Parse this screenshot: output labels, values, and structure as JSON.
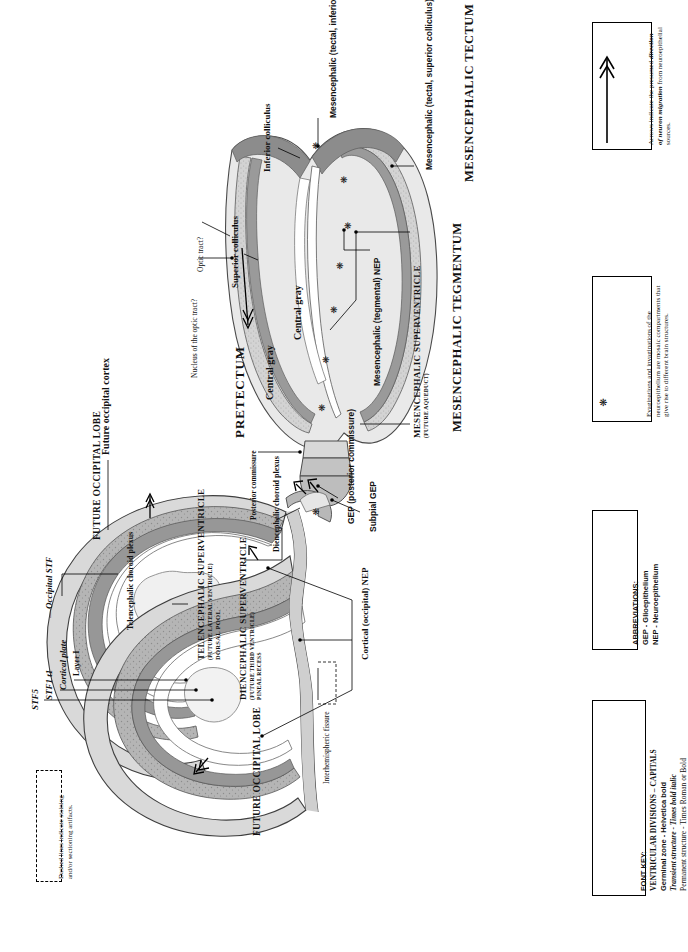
{
  "figure": {
    "orientation": "rotated-90-ccw",
    "type": "brain-section-schematic",
    "colors": {
      "neuroepithelium_dark": "#8f8f8f",
      "mantle_mid": "#b9b9b9",
      "cortex_light": "#dcdcdc",
      "ventricle_white": "#ffffff",
      "outline": "#3a3a3a",
      "text": "#111111"
    }
  },
  "labels": {
    "stf5": "STF5",
    "stf1t1": "STF1 t1",
    "occipital_stf": "Occipital STF",
    "cortical_plate": "Cortical plate",
    "layer_i": "Layer I",
    "future_occipital_cortex": "Future occipital cortex",
    "future_occipital_lobe_upper": "FUTURE OCCIPITAL LOBE",
    "future_occipital_lobe_lower": "FUTURE OCCIPITAL LOBE",
    "telencephalic_choroid_plexus": "Telencephalic choroid plexus",
    "telencephalic_superventricle": "TELENCEPHALIC SUPERVENTRICLE",
    "telencephalic_superventricle_sub": "(FUTURE LATERAL VENTRICLE)",
    "telencephalic_superventricle_sub2": "DORSAL POOL",
    "diencephalic_superventricle": "DIENCEPHALIC SUPERVENTRICLE",
    "diencephalic_superventricle_sub": "(FUTURE THIRD VENTRICLE)",
    "diencephalic_superventricle_sub2": "PINEAL RECESS",
    "diencephalic_choroid_plexus": "Diencephalic choroid plexus",
    "interhemispheric_fissure": "Interhemispheric fissure",
    "cortical_occipital_nep": "Cortical (occipital) NEP",
    "gep_posterior_commissure": "GEP (posterior commissure)",
    "subpial_gep": "Subpial GEP",
    "posterior_commissure": "Posterior commissure",
    "pretectum": "PRETECTUM",
    "central_gray_1": "Central gray",
    "central_gray_2": "Central gray",
    "nucleus_optic_tract": "Nucleus of the optic tract?",
    "optic_tract": "Optic tract?",
    "superior_colliculus": "Superior colliculus",
    "inferior_colliculus": "Inferior colliculus",
    "mesencephalic_tectal_inferior_nep": "Mesencephalic (tectal, inferior colliculus) NEP",
    "mesencephalic_tectal_superior_nep": "Mesencephalic (tectal, superior colliculus) NEP",
    "mesencephalic_tectum": "MESENCEPHALIC TECTUM",
    "mesencephalic_tegmental_nep": "Mesencephalic (tegmental) NEP",
    "mesencephalic_superventricle": "MESENCEPHALIC SUPERVENTRICLE",
    "mesencephalic_superventricle_sub": "(FUTURE AQUEDUCT)",
    "mesencephalic_tegmentum": "MESENCEPHALIC TEGMENTUM"
  },
  "notes": {
    "arrows": {
      "line1": "Arrows indicate the",
      "line2_a": "presumed ",
      "line2_b": "direction of",
      "line3_a": "neuron migration",
      "line3_b": " from",
      "line4": "neuroepithelial sources."
    },
    "asterisk": {
      "line1": "Evaginations and invaginations of the",
      "line2": "neuroepithelium are mosaic compartments",
      "line3": "that give rise to different brain structures."
    },
    "dashed": {
      "line1": "Dashed lines indicate staining",
      "line2": "and/or sectioning artifacts."
    }
  },
  "abbreviations": {
    "title": "ABBREVIATIONS:",
    "items": [
      "GEP - Glioepithelium",
      "NEP - Neuroepithelium"
    ]
  },
  "font_key": {
    "title": "FONT KEY:",
    "items": [
      "VENTRICULAR DIVISIONS – CAPITALS",
      "Germinal zone - Helvetica bold",
      "Transient structure - Times bold italic",
      "Permanent structure - Times Roman or Bold"
    ]
  }
}
